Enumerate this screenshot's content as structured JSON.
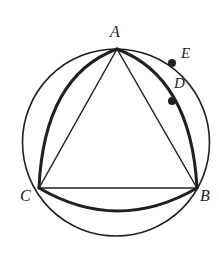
{
  "figure": {
    "kind": "geometry-diagram",
    "background_color": "#ffffff",
    "stroke_color": "#231f20",
    "canvas": {
      "width": 219,
      "height": 258
    }
  },
  "circle": {
    "name": "circumscribed-circle",
    "center_x": 116,
    "center_y": 142.5,
    "radius": 93.5,
    "stroke_width": 1.6
  },
  "triangle": {
    "name": "inscribed-triangle",
    "stroke_width": 1.5,
    "vertices": [
      {
        "id": "A",
        "label": "A",
        "x": 117,
        "y": 49
      },
      {
        "id": "B",
        "label": "B",
        "x": 197,
        "y": 188
      },
      {
        "id": "C",
        "label": "C",
        "x": 39,
        "y": 188
      }
    ],
    "sides": [
      {
        "id": "AC",
        "from": "A",
        "to": "C"
      },
      {
        "id": "AB",
        "from": "A",
        "to": "B"
      },
      {
        "id": "CB",
        "from": "C",
        "to": "B"
      }
    ]
  },
  "arcs": [
    {
      "id": "arc-AC",
      "name": "arc-a-to-c",
      "from": "A",
      "to": "C",
      "bulge_direction": "outward-left",
      "stroke_width": 3.0,
      "control_x": 44,
      "control_y": 76
    },
    {
      "id": "arc-AB",
      "name": "arc-a-to-b",
      "from": "A",
      "to": "B",
      "bulge_direction": "outward-right",
      "stroke_width": 3.0,
      "control_x": 191,
      "control_y": 77
    },
    {
      "id": "arc-CB",
      "name": "arc-c-to-b",
      "from": "C",
      "to": "B",
      "bulge_direction": "outward-down",
      "stroke_width": 3.0,
      "control_x": 118,
      "control_y": 234
    }
  ],
  "points": [
    {
      "id": "E",
      "label": "E",
      "name": "point-e",
      "x": 172,
      "y": 63,
      "radius": 4,
      "lies_on": "circumscribed-circle",
      "label_x": 181,
      "label_y": 46
    },
    {
      "id": "D",
      "label": "D",
      "name": "point-d",
      "x": 172,
      "y": 101,
      "radius": 4,
      "lies_on": "arc-AB",
      "label_x": 174,
      "label_y": 76
    }
  ],
  "labels": {
    "A": "A",
    "B": "B",
    "C": "C",
    "D": "D",
    "E": "E"
  }
}
